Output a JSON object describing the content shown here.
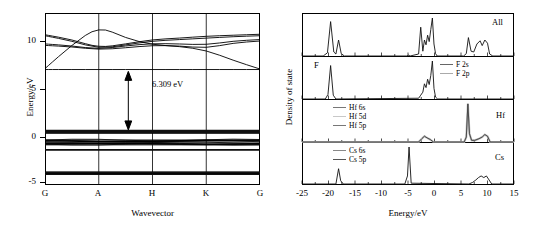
{
  "figure": {
    "title": "",
    "panels": [
      "band-structure",
      "density-of-states"
    ]
  },
  "band_panel": {
    "ytitle": "Energy/eV",
    "xtitle": "Wavevector",
    "yticks": [
      "10",
      "5",
      "0",
      "-5"
    ],
    "xticks": [
      "G",
      "A",
      "H",
      "K",
      "G"
    ],
    "gap_label": "6.309 eV"
  },
  "dos_panel": {
    "ytitle": "Density of state",
    "xtitle": "Energy/eV",
    "xticks": [
      "-25",
      "-20",
      "-15",
      "-10",
      "-5",
      "0",
      "5",
      "10",
      "15"
    ],
    "subpanels": [
      {
        "tag": "All",
        "tag_side": "right",
        "legend": []
      },
      {
        "tag": "F",
        "tag_side": "left",
        "legend": [
          "F 2s",
          "F 2p"
        ]
      },
      {
        "tag": "Hf",
        "tag_side": "right",
        "legend": [
          "Hf 6s",
          "Hf 5d",
          "Hf 5p"
        ]
      },
      {
        "tag": "Cs",
        "tag_side": "right",
        "legend": [
          "Cs 6s",
          "Cs 5p"
        ]
      }
    ]
  },
  "chart_data": [
    {
      "type": "line",
      "name": "band-structure",
      "title": "",
      "xlabel": "Wavevector",
      "ylabel": "Energy/eV",
      "ylim": [
        -5.6,
        12.2
      ],
      "grid": false,
      "xtick_labels": [
        "G",
        "A",
        "H",
        "K",
        "G"
      ],
      "xtick_positions": [
        0,
        1,
        2,
        3,
        4
      ],
      "ytick_values": [
        10,
        5,
        0,
        -5
      ],
      "band_gap_eV": 6.309,
      "valence_band_max_eV": 0.0,
      "conduction_band_min_eV": 6.309,
      "annotation": {
        "text": "6.309 eV",
        "x": 1.55,
        "y": 3.2
      },
      "bands": [
        {
          "name": "cb1",
          "x": [
            0,
            0.5,
            1,
            1.5,
            2,
            2.5,
            3,
            3.5,
            4
          ],
          "y": [
            6.45,
            8.9,
            10.85,
            9.6,
            8.9,
            8.75,
            8.35,
            7.3,
            6.4
          ]
        },
        {
          "name": "cb2",
          "x": [
            0,
            0.5,
            1,
            1.5,
            2,
            2.5,
            3,
            3.5,
            4
          ],
          "y": [
            9.95,
            9.45,
            8.6,
            9.0,
            9.45,
            9.6,
            9.8,
            9.9,
            10.0
          ]
        },
        {
          "name": "cb3",
          "x": [
            0,
            0.5,
            1,
            1.5,
            2,
            2.5,
            3,
            3.5,
            4
          ],
          "y": [
            9.85,
            9.3,
            8.5,
            8.9,
            9.3,
            9.45,
            9.6,
            9.75,
            9.85
          ]
        },
        {
          "name": "cb4",
          "x": [
            0,
            0.5,
            1,
            1.5,
            2,
            2.5,
            3,
            3.5,
            4
          ],
          "y": [
            9.0,
            8.8,
            8.45,
            8.8,
            9.05,
            9.0,
            8.9,
            9.3,
            9.45
          ]
        },
        {
          "name": "cb5",
          "x": [
            0,
            0.5,
            1,
            1.5,
            2,
            2.5,
            3,
            3.5,
            4
          ],
          "y": [
            8.85,
            8.7,
            8.4,
            8.6,
            8.85,
            8.8,
            8.55,
            9.1,
            9.3
          ]
        },
        {
          "name": "cb6",
          "x": [
            0,
            0.5,
            1,
            1.5,
            2,
            2.5,
            3,
            3.5,
            4
          ],
          "y": [
            6.35,
            6.35,
            6.35,
            6.35,
            6.35,
            6.35,
            6.35,
            6.35,
            6.35
          ]
        },
        {
          "name": "vb1",
          "x": [
            0,
            1,
            2,
            3,
            4
          ],
          "y": [
            0.0,
            0.0,
            0.0,
            0.0,
            0.0
          ]
        },
        {
          "name": "vb2",
          "x": [
            0,
            1,
            2,
            3,
            4
          ],
          "y": [
            -0.2,
            -0.2,
            -0.2,
            -0.2,
            -0.2
          ]
        },
        {
          "name": "vb3",
          "x": [
            0,
            1,
            2,
            3,
            4
          ],
          "y": [
            -1.0,
            -1.1,
            -1.05,
            -1.0,
            -1.0
          ]
        },
        {
          "name": "vb4",
          "x": [
            0,
            1,
            2,
            3,
            4
          ],
          "y": [
            -1.35,
            -1.3,
            -1.35,
            -1.4,
            -1.35
          ]
        },
        {
          "name": "vb5",
          "x": [
            0,
            1,
            2,
            3,
            4
          ],
          "y": [
            -1.95,
            -1.95,
            -1.95,
            -1.95,
            -1.95
          ]
        },
        {
          "name": "vb6",
          "x": [
            0,
            1,
            2,
            3,
            4
          ],
          "y": [
            -4.3,
            -4.3,
            -4.3,
            -4.3,
            -4.3
          ]
        },
        {
          "name": "vb7",
          "x": [
            0,
            1,
            2,
            3,
            4
          ],
          "y": [
            -4.45,
            -4.45,
            -4.45,
            -4.45,
            -4.45
          ]
        }
      ]
    },
    {
      "type": "line",
      "name": "dos-all",
      "title": "All",
      "xlabel": "Energy/eV",
      "ylabel": "Density of state",
      "xlim": [
        -25,
        15
      ],
      "grid": false,
      "x": [
        -25,
        -21,
        -20.2,
        -19.6,
        -19.0,
        -18.6,
        -18.1,
        -17.6,
        -17.0,
        -5.2,
        -4.9,
        -4.6,
        -3.0,
        -2.6,
        -2.2,
        -1.9,
        -1.6,
        -1.3,
        -1.0,
        -0.7,
        -0.4,
        -0.1,
        0.2,
        0.5,
        5.5,
        6.0,
        6.4,
        6.9,
        7.4,
        8.0,
        8.6,
        9.0,
        9.5,
        10.0,
        10.4,
        11.0,
        15
      ],
      "y": [
        0,
        0,
        0.08,
        0.86,
        0.1,
        0.05,
        0.4,
        0.06,
        0,
        0,
        0.02,
        0,
        0.05,
        0.72,
        0.12,
        0.4,
        0.28,
        0.52,
        0.36,
        0.66,
        0.95,
        0.3,
        0.06,
        0,
        0,
        0.06,
        0.46,
        0.12,
        0.1,
        0.3,
        0.38,
        0.26,
        0.4,
        0.32,
        0.05,
        0,
        0
      ]
    },
    {
      "type": "line",
      "name": "dos-F",
      "title": "F",
      "xlabel": "Energy/eV",
      "ylabel": "Density of state",
      "xlim": [
        -25,
        15
      ],
      "grid": false,
      "legend": [
        "F 2s",
        "F 2p"
      ],
      "x": [
        -25,
        -20.6,
        -20.1,
        -19.6,
        -19.1,
        -18.6,
        -3.0,
        -2.6,
        -2.2,
        -1.9,
        -1.6,
        -1.3,
        -1.0,
        -0.7,
        -0.4,
        -0.1,
        0.2,
        0.6,
        15
      ],
      "y": [
        0,
        0,
        0.12,
        0.88,
        0.1,
        0,
        0.02,
        0.1,
        0.18,
        0.4,
        0.3,
        0.52,
        0.38,
        0.62,
        1.0,
        0.28,
        0.05,
        0,
        0
      ]
    },
    {
      "type": "line",
      "name": "dos-Hf",
      "title": "Hf",
      "xlabel": "Energy/eV",
      "ylabel": "Density of state",
      "xlim": [
        -25,
        15
      ],
      "grid": false,
      "legend": [
        "Hf 6s",
        "Hf 5d",
        "Hf 5p"
      ],
      "x": [
        -25,
        -3.0,
        -2.4,
        -1.9,
        -1.4,
        -0.8,
        -0.2,
        5.6,
        6.0,
        6.3,
        6.6,
        7.0,
        7.6,
        8.4,
        9.0,
        9.5,
        10.0,
        10.5,
        15
      ],
      "y": [
        0,
        0,
        0.08,
        0.14,
        0.1,
        0.06,
        0,
        0,
        0.12,
        0.92,
        0.2,
        0.04,
        0.04,
        0.08,
        0.12,
        0.18,
        0.14,
        0,
        0
      ]
    },
    {
      "type": "line",
      "name": "dos-Cs",
      "title": "Cs",
      "xlabel": "Energy/eV",
      "ylabel": "Density of state",
      "xlim": [
        -25,
        15
      ],
      "grid": false,
      "legend": [
        "Cs 6s",
        "Cs 5p"
      ],
      "x": [
        -25,
        -18.6,
        -18.1,
        -17.7,
        -17.2,
        -5.6,
        -5.1,
        -4.8,
        -4.4,
        6.5,
        7.2,
        7.8,
        8.3,
        8.8,
        9.3,
        9.8,
        10.3,
        10.8,
        15
      ],
      "y": [
        0,
        0,
        0.38,
        0.08,
        0,
        0,
        0.2,
        0.92,
        0.02,
        0,
        0.04,
        0.1,
        0.16,
        0.2,
        0.16,
        0.2,
        0.1,
        0,
        0
      ]
    }
  ]
}
